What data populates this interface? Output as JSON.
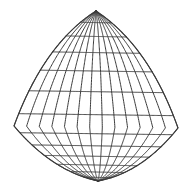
{
  "figure": {
    "background_color": "#ffffff",
    "line_color": "#3a3a3a",
    "line_width": 1,
    "canvas": {
      "width": 192,
      "height": 195
    }
  },
  "chart_data": {
    "type": "mesh",
    "title": "",
    "xlabel": "",
    "ylabel": "",
    "grid": true,
    "legend": null,
    "divisions_u": 13,
    "divisions_v": 13,
    "xlim": [
      0,
      192
    ],
    "ylim": [
      0,
      195
    ],
    "corners": {
      "top": [
        96,
        11
      ],
      "left": [
        14,
        126
      ],
      "right": [
        178,
        128
      ],
      "bottom": [
        98,
        181
      ]
    },
    "edges": {
      "top_left": {
        "name": "upper-left-arc",
        "from": [
          96,
          11
        ],
        "to": [
          14,
          126
        ],
        "control": [
          44,
          44
        ],
        "curvature": "convex-outward"
      },
      "top_right": {
        "name": "upper-right-arc",
        "from": [
          96,
          11
        ],
        "to": [
          178,
          128
        ],
        "control": [
          149,
          46
        ],
        "curvature": "convex-outward"
      },
      "bottom_left": {
        "name": "lower-left-arc",
        "from": [
          14,
          126
        ],
        "to": [
          98,
          181
        ],
        "control": [
          52,
          171
        ],
        "curvature": "convex-outward"
      },
      "bottom_right": {
        "name": "lower-right-arc",
        "from": [
          178,
          128
        ],
        "to": [
          98,
          181
        ],
        "control": [
          142,
          173
        ],
        "curvature": "convex-outward"
      }
    }
  }
}
